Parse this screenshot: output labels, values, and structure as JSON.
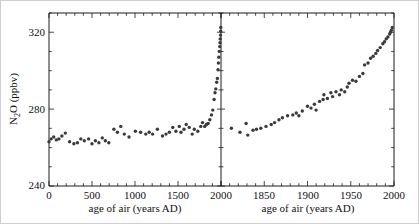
{
  "chart_data": {
    "type": "scatter",
    "title": "",
    "ylabel": "N2O (ppbv)",
    "ylabel_parts": {
      "pre": "N",
      "sub": "2",
      "post": "O (ppbv)"
    },
    "ylim": [
      240,
      330
    ],
    "y_major_ticks": [
      240,
      280,
      320
    ],
    "y_minor_step": 10,
    "grid": false,
    "legend": "none",
    "point_color": "#3a3a3a",
    "axis_color": "#1c1c1c",
    "panels": [
      {
        "name": "full-record",
        "xlabel": "age of air (years AD)",
        "xlim": [
          0,
          2000
        ],
        "x_major_ticks": [
          0,
          500,
          1000,
          1500,
          2000
        ],
        "x_major_every": 500,
        "x_minor_step": 100,
        "points": [
          [
            0,
            263
          ],
          [
            25,
            264.5
          ],
          [
            55,
            265.5
          ],
          [
            85,
            264
          ],
          [
            115,
            264.5
          ],
          [
            150,
            266
          ],
          [
            190,
            267.5
          ],
          [
            240,
            263
          ],
          [
            290,
            262
          ],
          [
            330,
            262.5
          ],
          [
            370,
            264.5
          ],
          [
            410,
            263.5
          ],
          [
            460,
            264.5
          ],
          [
            500,
            262
          ],
          [
            540,
            263.5
          ],
          [
            580,
            262.5
          ],
          [
            620,
            265
          ],
          [
            655,
            263.5
          ],
          [
            695,
            262.5
          ],
          [
            755,
            269.5
          ],
          [
            795,
            268
          ],
          [
            835,
            271
          ],
          [
            875,
            267
          ],
          [
            930,
            265.5
          ],
          [
            1005,
            268.5
          ],
          [
            1065,
            268
          ],
          [
            1125,
            267
          ],
          [
            1165,
            268
          ],
          [
            1205,
            267
          ],
          [
            1260,
            269.5
          ],
          [
            1320,
            266
          ],
          [
            1360,
            267
          ],
          [
            1400,
            268
          ],
          [
            1440,
            270.5
          ],
          [
            1475,
            268.5
          ],
          [
            1515,
            271
          ],
          [
            1535,
            268
          ],
          [
            1570,
            269.5
          ],
          [
            1595,
            272
          ],
          [
            1630,
            270.5
          ],
          [
            1665,
            267
          ],
          [
            1690,
            269.5
          ],
          [
            1730,
            268.5
          ],
          [
            1765,
            271
          ],
          [
            1785,
            273
          ],
          [
            1810,
            271
          ],
          [
            1830,
            272
          ],
          [
            1850,
            272.5
          ],
          [
            1870,
            274.5
          ],
          [
            1890,
            277
          ],
          [
            1905,
            279.5
          ],
          [
            1920,
            285
          ],
          [
            1930,
            288.5
          ],
          [
            1940,
            290.5
          ],
          [
            1950,
            294
          ],
          [
            1958,
            296
          ],
          [
            1965,
            300.5
          ],
          [
            1970,
            304
          ],
          [
            1975,
            307
          ],
          [
            1980,
            310
          ],
          [
            1985,
            312.5
          ],
          [
            1988,
            314.5
          ],
          [
            1991,
            316.5
          ],
          [
            1994,
            318.5
          ],
          [
            1996,
            320.5
          ],
          [
            1998,
            322.5
          ]
        ]
      },
      {
        "name": "industrial-era",
        "xlabel": "age of air (years AD)",
        "xlim": [
          1800,
          2000
        ],
        "x_major_ticks": [
          1850,
          1900,
          1950,
          2000
        ],
        "x_major_every": 50,
        "x_minor_step": 10,
        "points": [
          [
            1812,
            270
          ],
          [
            1822,
            268
          ],
          [
            1829,
            272.5
          ],
          [
            1831,
            266.5
          ],
          [
            1837,
            269
          ],
          [
            1841,
            269.5
          ],
          [
            1846,
            270
          ],
          [
            1852,
            271
          ],
          [
            1858,
            272
          ],
          [
            1862,
            273
          ],
          [
            1867,
            274.5
          ],
          [
            1871,
            275.5
          ],
          [
            1877,
            276.5
          ],
          [
            1883,
            277
          ],
          [
            1887,
            278
          ],
          [
            1890,
            276.5
          ],
          [
            1894,
            279
          ],
          [
            1900,
            281.5
          ],
          [
            1904,
            280.5
          ],
          [
            1908,
            282.5
          ],
          [
            1910,
            279.5
          ],
          [
            1914,
            284
          ],
          [
            1918,
            285
          ],
          [
            1919,
            287.5
          ],
          [
            1923,
            285.5
          ],
          [
            1927,
            288.5
          ],
          [
            1929,
            286.5
          ],
          [
            1933,
            289
          ],
          [
            1937,
            287.5
          ],
          [
            1939,
            290
          ],
          [
            1943,
            289
          ],
          [
            1946,
            291.5
          ],
          [
            1948,
            293.5
          ],
          [
            1952,
            295
          ],
          [
            1956,
            294.5
          ],
          [
            1960,
            297
          ],
          [
            1964,
            298.5
          ],
          [
            1966,
            303
          ],
          [
            1970,
            304
          ],
          [
            1973,
            306.5
          ],
          [
            1976,
            307.5
          ],
          [
            1979,
            309
          ],
          [
            1981,
            310.5
          ],
          [
            1984,
            312
          ],
          [
            1987,
            314
          ],
          [
            1989,
            315
          ],
          [
            1991,
            316.5
          ],
          [
            1993,
            317.5
          ],
          [
            1995,
            319
          ],
          [
            1996,
            320
          ],
          [
            1997,
            321
          ],
          [
            1998,
            322.5
          ]
        ]
      }
    ]
  }
}
